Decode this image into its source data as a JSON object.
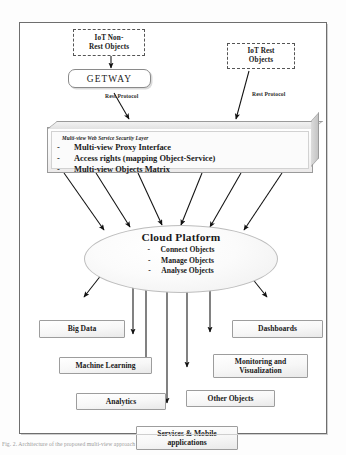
{
  "diagram": {
    "caption": "Fig. 2.  Architecture  of  the  proposed  multi-view  approach"
  },
  "sources": {
    "non_rest": {
      "line1": "IoT Non-",
      "line2": "Rest Objects"
    },
    "rest": {
      "line1": "IoT Rest",
      "line2": "Objects"
    }
  },
  "gateway": {
    "label": "GETWAY"
  },
  "protocol_labels": {
    "left": "Rest Protocol",
    "right": "Rest Protocol"
  },
  "security_layer": {
    "title": "Multi-view Web Service Security Layer",
    "bullet": "-",
    "items": [
      "Multi-view Proxy Interface",
      "Access rights (mapping Object-Service)",
      "Multi-view Objects Matrix"
    ]
  },
  "cloud": {
    "title": "Cloud Platform",
    "bullet": "-",
    "items": [
      "Connect Objects",
      "Manage Objects",
      "Analyse Objects"
    ]
  },
  "consumers": [
    {
      "id": "big-data",
      "label": "Big Data"
    },
    {
      "id": "machine-learning",
      "label": "Machine Learning"
    },
    {
      "id": "analytics",
      "label": "Analytics"
    },
    {
      "id": "dashboards",
      "label": "Dashboards"
    },
    {
      "id": "monitoring",
      "line1": "Monitoring and",
      "line2": "Visualization"
    },
    {
      "id": "other-objects",
      "label": "Other Objects"
    },
    {
      "id": "services-mobile",
      "line1": "Services & Mobile",
      "line2": "applications"
    }
  ],
  "colors": {
    "frame_border": "#6e6e6e",
    "node_border": "#9d9d9d",
    "dashed_border": "#555555",
    "gateway_border": "#8a8a8a",
    "arrow": "#111111",
    "page_bg": "#ffffff"
  }
}
